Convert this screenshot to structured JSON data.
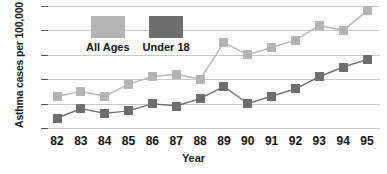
{
  "chart_data": {
    "type": "line",
    "title": "",
    "xlabel": "Year",
    "ylabel": "Asthma cases per 100,000",
    "categories": [
      "82",
      "83",
      "84",
      "85",
      "86",
      "87",
      "88",
      "89",
      "90",
      "91",
      "92",
      "93",
      "94",
      "95"
    ],
    "ylim": [
      30,
      80
    ],
    "yticks": [
      30,
      40,
      50,
      60,
      70,
      80
    ],
    "grid": true,
    "legend_position": "top-center",
    "series": [
      {
        "name": "All Ages",
        "color": "#b4b4b4",
        "values": [
          43,
          45,
          43,
          48,
          51,
          52,
          50,
          65,
          60,
          63,
          66,
          72,
          70,
          78
        ]
      },
      {
        "name": "Under 18",
        "color": "#6e6e6e",
        "values": [
          34,
          38,
          36,
          37,
          40,
          39,
          42,
          47,
          40,
          43,
          46,
          51,
          55,
          58
        ]
      }
    ]
  },
  "axes": {
    "y_title": "Asthma cases per 100,000",
    "x_title": "Year",
    "y_tick_labels": [
      "80",
      "70",
      "60",
      "50",
      "40",
      "30"
    ],
    "x_tick_labels": [
      "82",
      "83",
      "84",
      "85",
      "86",
      "87",
      "88",
      "89",
      "90",
      "91",
      "92",
      "93",
      "94",
      "95"
    ]
  },
  "legend": {
    "items": [
      {
        "label": "All Ages",
        "color": "#b4b4b4",
        "swatch": "legend-swatch-all-ages"
      },
      {
        "label": "Under 18",
        "color": "#6e6e6e",
        "swatch": "legend-swatch-under-18"
      }
    ]
  }
}
